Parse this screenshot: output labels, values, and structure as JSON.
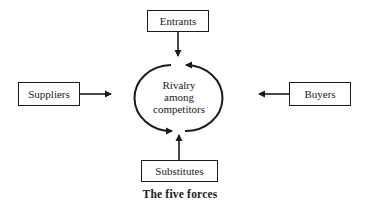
{
  "diagram": {
    "title": "The five forces",
    "center": {
      "lines": [
        "Rivalry",
        "among",
        "competitors"
      ]
    },
    "forces": {
      "top": "Entrants",
      "left": "Suppliers",
      "right": "Buyers",
      "bottom": "Substitutes"
    },
    "colors": {
      "line": "#1a1a1a",
      "background": "#ffffff"
    }
  }
}
